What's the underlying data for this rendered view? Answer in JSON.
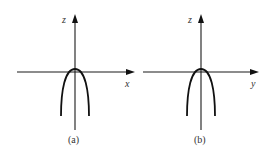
{
  "figure": {
    "panels": [
      {
        "id": "a",
        "caption": "(a)",
        "vertical_axis_label": "z",
        "horizontal_axis_label": "x",
        "curve": "downward-opening parabola with apex slightly above origin"
      },
      {
        "id": "b",
        "caption": "(b)",
        "vertical_axis_label": "z",
        "horizontal_axis_label": "y",
        "curve": "downward-opening parabola with apex slightly above origin"
      }
    ],
    "colors": {
      "line": "#111111",
      "text": "#333333",
      "background": "#ffffff"
    }
  }
}
